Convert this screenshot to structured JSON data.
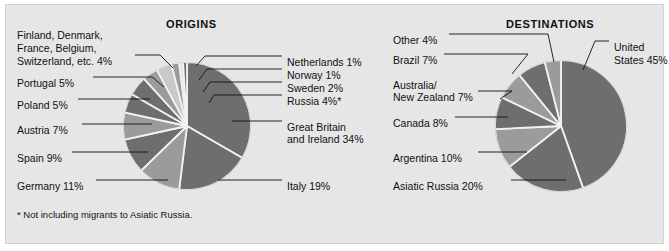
{
  "figure": {
    "background": "#ffffff",
    "panel_color": "#e6e6e6",
    "footnote": "* Not including migrants to Asiatic Russia."
  },
  "charts": {
    "origins": {
      "title": "ORIGINS",
      "center": {
        "x": 187,
        "y": 126
      },
      "radius": 64,
      "labels_left": [
        {
          "text": "Finland, Denmark,",
          "x": 17,
          "y": 29
        },
        {
          "text": "France, Belgium,",
          "x": 17,
          "y": 42
        },
        {
          "text": "Switzerland, etc.  4%",
          "x": 17,
          "y": 55
        },
        {
          "text": "Portugal  5%",
          "x": 17,
          "y": 77
        },
        {
          "text": "Poland  5%",
          "x": 17,
          "y": 99
        },
        {
          "text": "Austria  7%",
          "x": 17,
          "y": 124
        },
        {
          "text": "Spain  9%",
          "x": 17,
          "y": 152
        },
        {
          "text": "Germany  11%",
          "x": 17,
          "y": 180
        }
      ],
      "labels_right": [
        {
          "text": "Netherlands  1%",
          "x": 287,
          "y": 56
        },
        {
          "text": "Norway  1%",
          "x": 287,
          "y": 69
        },
        {
          "text": "Sweden  2%",
          "x": 287,
          "y": 82
        },
        {
          "text": "Russia  4%*",
          "x": 287,
          "y": 95
        },
        {
          "text": "Great Britain",
          "x": 287,
          "y": 121
        },
        {
          "text": "and Ireland  34%",
          "x": 287,
          "y": 133
        },
        {
          "text": "Italy  19%",
          "x": 287,
          "y": 180
        }
      ]
    },
    "destinations": {
      "title": "DESTINATIONS",
      "center": {
        "x": 561,
        "y": 126
      },
      "radius": 66,
      "labels_left": [
        {
          "text": "Other  4%",
          "x": 393,
          "y": 34
        },
        {
          "text": "Brazil  7%",
          "x": 393,
          "y": 54
        },
        {
          "text": "Australia/",
          "x": 393,
          "y": 79
        },
        {
          "text": "New Zealand  7%",
          "x": 393,
          "y": 91
        },
        {
          "text": "Canada  8%",
          "x": 393,
          "y": 117
        },
        {
          "text": "Argentina  10%",
          "x": 393,
          "y": 152
        },
        {
          "text": "Asiatic Russia  20%",
          "x": 393,
          "y": 180
        }
      ],
      "labels_right": [
        {
          "text": "United",
          "x": 614,
          "y": 41
        },
        {
          "text": "States 45%",
          "x": 614,
          "y": 54
        }
      ]
    }
  },
  "chart_data": [
    {
      "type": "pie",
      "title": "ORIGINS",
      "unit": "percent",
      "note": "* Not including migrants to Asiatic Russia.",
      "categories": [
        "Great Britain and Ireland",
        "Italy",
        "Germany",
        "Spain",
        "Austria",
        "Poland",
        "Portugal",
        "Finland, Denmark, France, Belgium, Switzerland, etc.",
        "Russia",
        "Sweden",
        "Norway",
        "Netherlands"
      ],
      "values": [
        34,
        19,
        11,
        9,
        7,
        5,
        5,
        4,
        4,
        2,
        1,
        1
      ],
      "labels": [
        "Great Britain and Ireland  34%",
        "Italy  19%",
        "Germany  11%",
        "Spain  9%",
        "Austria  7%",
        "Poland  5%",
        "Portugal  5%",
        "Finland, Denmark, France, Belgium, Switzerland, etc.  4%",
        "Russia  4%*",
        "Sweden  2%",
        "Norway  1%",
        "Netherlands  1%"
      ],
      "colors": [
        "#6e6e6e",
        "#6e6e6e",
        "#9b9b9b",
        "#6e6e6e",
        "#9b9b9b",
        "#6e6e6e",
        "#6e6e6e",
        "#9b9b9b",
        "#c9c9c9",
        "#9b9b9b",
        "#e0e0e0",
        "#6e6e6e"
      ],
      "start_angle_deg": -90,
      "direction": "clockwise",
      "legend": "callout-labels"
    },
    {
      "type": "pie",
      "title": "DESTINATIONS",
      "unit": "percent",
      "categories": [
        "United States",
        "Asiatic Russia",
        "Argentina",
        "Canada",
        "Australia/New Zealand",
        "Brazil",
        "Other"
      ],
      "values": [
        45,
        20,
        10,
        8,
        7,
        7,
        4
      ],
      "labels": [
        "United States 45%",
        "Asiatic Russia  20%",
        "Argentina  10%",
        "Canada  8%",
        "Australia/New Zealand  7%",
        "Brazil  7%",
        "Other  4%"
      ],
      "colors": [
        "#6e6e6e",
        "#6e6e6e",
        "#9b9b9b",
        "#6e6e6e",
        "#9b9b9b",
        "#6e6e6e",
        "#9b9b9b"
      ],
      "start_angle_deg": -90,
      "direction": "clockwise",
      "legend": "callout-labels"
    }
  ]
}
